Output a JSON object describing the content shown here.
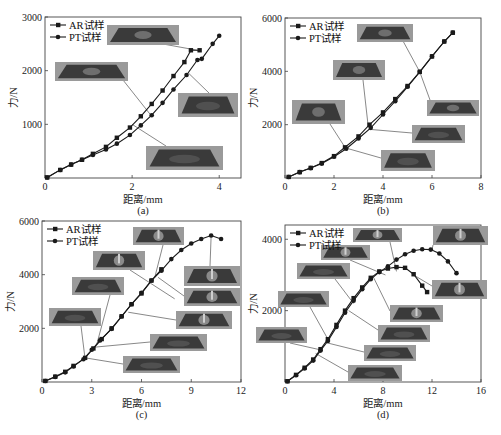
{
  "legend": {
    "ar": "AR试样",
    "pt": "PT试样"
  },
  "xlabel": "距离/mm",
  "ylabel": "力/N",
  "chart_data": [
    {
      "id": "a",
      "type": "line",
      "caption": "(a)",
      "xlabel": "距离/mm",
      "ylabel": "力/N",
      "box": {
        "left": 45,
        "top": 17,
        "right": 241,
        "bottom": 178
      },
      "xlim": [
        0,
        4.5
      ],
      "ylim": [
        0,
        3000
      ],
      "xticks": [
        0,
        2,
        4
      ],
      "yticks": [
        1000,
        2000,
        3000
      ],
      "xzero_label": "0",
      "series": [
        {
          "name": "AR试样",
          "marker": "square",
          "x": [
            0.05,
            0.35,
            0.6,
            0.85,
            1.1,
            1.4,
            1.65,
            1.95,
            2.2,
            2.45,
            2.7,
            2.95,
            3.2,
            3.35,
            3.55
          ],
          "y": [
            10,
            150,
            250,
            340,
            450,
            580,
            750,
            940,
            1150,
            1380,
            1630,
            1900,
            2160,
            2380,
            2380
          ]
        },
        {
          "name": "PT试样",
          "marker": "circle",
          "x": [
            0.05,
            0.35,
            0.6,
            0.85,
            1.1,
            1.4,
            1.65,
            1.95,
            2.2,
            2.45,
            2.7,
            2.95,
            3.25,
            3.5,
            3.6,
            3.85,
            4.0
          ],
          "y": [
            10,
            150,
            250,
            340,
            430,
            530,
            640,
            800,
            980,
            1170,
            1400,
            1650,
            1920,
            2200,
            2220,
            2500,
            2650
          ]
        }
      ],
      "annotations": [
        {
          "label": "inset-photo-1",
          "x": 107,
          "y": 25,
          "w": 72,
          "h": 20,
          "tx": 3.5,
          "ty": 2380,
          "sx": 163,
          "sy": 44,
          "style": "dent"
        },
        {
          "label": "inset-photo-2",
          "x": 55,
          "y": 62,
          "w": 73,
          "h": 19,
          "tx": 2.45,
          "ty": 1150,
          "sx": 123,
          "sy": 80,
          "style": "dent"
        },
        {
          "label": "inset-photo-3",
          "x": 178,
          "y": 93,
          "w": 60,
          "h": 24,
          "tx": 3.3,
          "ty": 1950,
          "sx": 209,
          "sy": 93,
          "style": "flat"
        },
        {
          "label": "inset-photo-4",
          "x": 146,
          "y": 146,
          "w": 77,
          "h": 24,
          "tx": 2.0,
          "ty": 1000,
          "sx": 166,
          "sy": 146,
          "style": "flat"
        }
      ]
    },
    {
      "id": "b",
      "type": "line",
      "caption": "(b)",
      "xlabel": "距离/mm",
      "ylabel": "力/N",
      "box": {
        "left": 285,
        "top": 18,
        "right": 481,
        "bottom": 178
      },
      "xlim": [
        0,
        8
      ],
      "ylim": [
        0,
        6000
      ],
      "xticks": [
        0,
        2,
        4,
        6,
        8
      ],
      "yticks": [
        2000,
        4000,
        6000
      ],
      "xzero_label": "0",
      "series": [
        {
          "name": "AR试样",
          "marker": "square",
          "x": [
            0.15,
            0.6,
            1.05,
            1.5,
            2.0,
            2.45,
            3.0,
            3.45,
            4.0,
            4.5,
            5.0,
            5.5,
            6.0,
            6.5,
            6.85
          ],
          "y": [
            40,
            220,
            380,
            560,
            820,
            1150,
            1560,
            2000,
            2460,
            2960,
            3450,
            3980,
            4560,
            5120,
            5450
          ]
        },
        {
          "name": "PT试样",
          "marker": "circle",
          "x": [
            0.15,
            0.6,
            1.05,
            1.5,
            2.0,
            2.5,
            3.0,
            3.5,
            4.0,
            4.5,
            5.0,
            5.5,
            6.0,
            6.5,
            6.85
          ],
          "y": [
            40,
            220,
            370,
            540,
            800,
            1100,
            1480,
            1880,
            2380,
            2880,
            3420,
            3980,
            4560,
            5120,
            5450
          ]
        }
      ],
      "annotations": [
        {
          "label": "inset-photo-1",
          "x": 357,
          "y": 24,
          "w": 56,
          "h": 18,
          "tx": 5.5,
          "ty": 3980,
          "sx": 403,
          "sy": 41,
          "style": "dent"
        },
        {
          "label": "inset-photo-2",
          "x": 333,
          "y": 60,
          "w": 52,
          "h": 20,
          "tx": 3.4,
          "ty": 1900,
          "sx": 363,
          "sy": 80,
          "style": "dent"
        },
        {
          "label": "inset-photo-3",
          "x": 292,
          "y": 100,
          "w": 53,
          "h": 24,
          "tx": 2.45,
          "ty": 1150,
          "sx": 330,
          "sy": 124,
          "style": "dent"
        },
        {
          "label": "inset-photo-4",
          "x": 427,
          "y": 100,
          "w": 52,
          "h": 16,
          "tx": 5.5,
          "ty": 3980,
          "sx": 430,
          "sy": 100,
          "style": "dent"
        },
        {
          "label": "inset-photo-5",
          "x": 412,
          "y": 125,
          "w": 53,
          "h": 18,
          "tx": 3.5,
          "ty": 1820,
          "sx": 412,
          "sy": 133,
          "style": "flat"
        },
        {
          "label": "inset-photo-6",
          "x": 381,
          "y": 150,
          "w": 54,
          "h": 21,
          "tx": 2.5,
          "ty": 1120,
          "sx": 381,
          "sy": 158,
          "style": "flat"
        }
      ]
    },
    {
      "id": "c",
      "type": "line",
      "caption": "(c)",
      "xlabel": "距离/mm",
      "ylabel": "力/N",
      "box": {
        "left": 42,
        "top": 221,
        "right": 241,
        "bottom": 382
      },
      "xlim": [
        0,
        12
      ],
      "ylim": [
        0,
        6000
      ],
      "xticks": [
        0,
        3,
        6,
        9,
        12
      ],
      "yticks": [
        2000,
        4000,
        6000
      ],
      "xzero_label": "0",
      "series": [
        {
          "name": "AR试样",
          "marker": "square",
          "x": [
            0.2,
            0.8,
            1.4,
            1.9,
            2.6,
            3.1,
            3.6,
            4.2,
            4.8,
            5.4,
            6.0,
            6.6,
            7.2
          ],
          "y": [
            40,
            200,
            380,
            600,
            900,
            1250,
            1600,
            2000,
            2450,
            2900,
            3300,
            3780,
            4200
          ]
        },
        {
          "name": "PT试样",
          "marker": "circle",
          "x": [
            0.2,
            0.8,
            1.4,
            1.9,
            2.5,
            3.0,
            3.5,
            4.2,
            4.8,
            5.4,
            6.0,
            6.6,
            7.2,
            7.8,
            8.4,
            9.0,
            9.6,
            10.2,
            10.8
          ],
          "y": [
            40,
            190,
            360,
            580,
            850,
            1200,
            1550,
            1980,
            2440,
            2900,
            3320,
            3780,
            4150,
            4580,
            4920,
            5160,
            5330,
            5460,
            5330
          ]
        }
      ],
      "annotations": [
        {
          "label": "inset-photo-1",
          "x": 133,
          "y": 227,
          "w": 51,
          "h": 18,
          "tx": 6.8,
          "ty": 3900,
          "sx": 163,
          "sy": 245,
          "style": "spike"
        },
        {
          "label": "inset-photo-2",
          "x": 93,
          "y": 251,
          "w": 52,
          "h": 19,
          "tx": 8.0,
          "ty": 3100,
          "sx": 130,
          "sy": 270,
          "style": "spike"
        },
        {
          "label": "inset-photo-3",
          "x": 72,
          "y": 277,
          "w": 52,
          "h": 18,
          "tx": 3.3,
          "ty": 1400,
          "sx": 110,
          "sy": 295,
          "style": "flat"
        },
        {
          "label": "inset-photo-4",
          "x": 49,
          "y": 308,
          "w": 52,
          "h": 18,
          "tx": 2.6,
          "ty": 850,
          "sx": 81,
          "sy": 326,
          "style": "flat"
        },
        {
          "label": "inset-photo-5",
          "x": 184,
          "y": 266,
          "w": 56,
          "h": 20,
          "tx": 10.2,
          "ty": 5460,
          "sx": 210,
          "sy": 266,
          "style": "spike"
        },
        {
          "label": "inset-photo-6",
          "x": 184,
          "y": 288,
          "w": 56,
          "h": 18,
          "tx": 7.0,
          "ty": 3900,
          "sx": 184,
          "sy": 296,
          "style": "spike"
        },
        {
          "label": "inset-photo-7",
          "x": 176,
          "y": 311,
          "w": 56,
          "h": 18,
          "tx": 5.2,
          "ty": 2600,
          "sx": 176,
          "sy": 320,
          "style": "spike"
        },
        {
          "label": "inset-photo-8",
          "x": 150,
          "y": 334,
          "w": 57,
          "h": 17,
          "tx": 3.2,
          "ty": 1300,
          "sx": 150,
          "sy": 342,
          "style": "flat"
        },
        {
          "label": "inset-photo-9",
          "x": 123,
          "y": 356,
          "w": 57,
          "h": 17,
          "tx": 2.6,
          "ty": 900,
          "sx": 123,
          "sy": 364,
          "style": "flat"
        }
      ]
    },
    {
      "id": "d",
      "type": "line",
      "caption": "(d)",
      "xlabel": "距离/mm",
      "ylabel": "力/N",
      "box": {
        "left": 285,
        "top": 225,
        "right": 481,
        "bottom": 382
      },
      "xlim": [
        0,
        16
      ],
      "ylim": [
        0,
        4400
      ],
      "xticks": [
        0,
        4,
        8,
        12,
        16
      ],
      "yticks": [
        2000,
        4000
      ],
      "xzero_label": "0",
      "series": [
        {
          "name": "AR试样",
          "marker": "square",
          "x": [
            0.2,
            0.9,
            1.6,
            2.3,
            2.9,
            3.5,
            4.2,
            4.9,
            5.6,
            6.3,
            7.0,
            7.7,
            8.4,
            9.1,
            9.8,
            10.5,
            11.2,
            11.6
          ],
          "y": [
            20,
            200,
            400,
            630,
            920,
            1200,
            1600,
            2000,
            2350,
            2650,
            2920,
            3100,
            3180,
            3220,
            3200,
            3020,
            2700,
            2520
          ]
        },
        {
          "name": "PT试样",
          "marker": "circle",
          "x": [
            0.2,
            0.9,
            1.6,
            2.3,
            2.9,
            3.5,
            4.2,
            4.9,
            5.6,
            6.3,
            7.0,
            7.7,
            8.4,
            9.1,
            9.8,
            10.5,
            11.2,
            11.9,
            12.6,
            13.3,
            14.0
          ],
          "y": [
            20,
            190,
            380,
            600,
            880,
            1150,
            1540,
            1940,
            2280,
            2600,
            2880,
            3080,
            3240,
            3430,
            3580,
            3680,
            3720,
            3710,
            3600,
            3380,
            3050
          ]
        }
      ],
      "annotations": [
        {
          "label": "inset-photo-1",
          "x": 353,
          "y": 228,
          "w": 49,
          "h": 14,
          "tx": 9.1,
          "ty": 3100,
          "sx": 390,
          "sy": 242,
          "style": "spike"
        },
        {
          "label": "inset-photo-2",
          "x": 321,
          "y": 245,
          "w": 49,
          "h": 15,
          "tx": 8.2,
          "ty": 3000,
          "sx": 350,
          "sy": 260,
          "style": "spike"
        },
        {
          "label": "inset-photo-3",
          "x": 297,
          "y": 263,
          "w": 53,
          "h": 16,
          "tx": 5.6,
          "ty": 2200,
          "sx": 335,
          "sy": 279,
          "style": "flat"
        },
        {
          "label": "inset-photo-4",
          "x": 278,
          "y": 291,
          "w": 51,
          "h": 16,
          "tx": 3.5,
          "ty": 1200,
          "sx": 310,
          "sy": 307,
          "style": "flat"
        },
        {
          "label": "inset-photo-5",
          "x": 256,
          "y": 327,
          "w": 51,
          "h": 16,
          "tx": 2.9,
          "ty": 900,
          "sx": 290,
          "sy": 343,
          "style": "flat"
        },
        {
          "label": "inset-photo-6",
          "x": 433,
          "y": 226,
          "w": 55,
          "h": 19,
          "tx": 12.0,
          "ty": 3700,
          "sx": 433,
          "sy": 245,
          "style": "spike"
        },
        {
          "label": "inset-photo-7",
          "x": 432,
          "y": 280,
          "w": 55,
          "h": 19,
          "tx": 10.5,
          "ty": 3000,
          "sx": 432,
          "sy": 286,
          "style": "spike"
        },
        {
          "label": "inset-photo-8",
          "x": 390,
          "y": 305,
          "w": 53,
          "h": 17,
          "tx": 7.2,
          "ty": 2950,
          "sx": 390,
          "sy": 311,
          "style": "spike"
        },
        {
          "label": "inset-photo-9",
          "x": 378,
          "y": 325,
          "w": 52,
          "h": 17,
          "tx": 5.2,
          "ty": 2000,
          "sx": 378,
          "sy": 330,
          "style": "flat"
        },
        {
          "label": "inset-photo-10",
          "x": 364,
          "y": 345,
          "w": 52,
          "h": 16,
          "tx": 3.4,
          "ty": 1100,
          "sx": 364,
          "sy": 352,
          "style": "flat"
        },
        {
          "label": "inset-photo-11",
          "x": 348,
          "y": 365,
          "w": 54,
          "h": 16,
          "tx": 2.5,
          "ty": 800,
          "sx": 348,
          "sy": 372,
          "style": "flat"
        }
      ]
    }
  ],
  "colors": {
    "line": "#1a1a1a",
    "frame": "#444444",
    "photo_bg": "#9a9a9a",
    "photo_dark": "#3a3a3a",
    "leader": "#555555"
  }
}
